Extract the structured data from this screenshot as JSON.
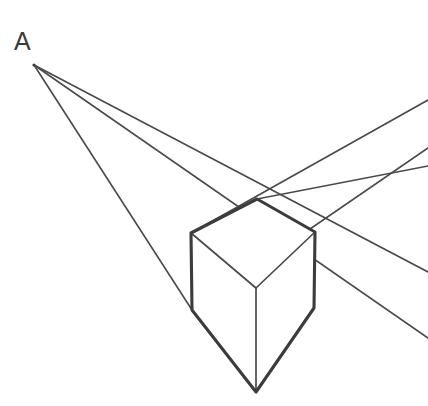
{
  "figure": {
    "type": "line-diagram",
    "canvas": {
      "width": 428,
      "height": 406,
      "background": "#ffffff"
    },
    "stroke_colors": {
      "construction": "#4a4a4a",
      "cube_heavy": "#3c3c3c",
      "cube_light": "#4a4a4a",
      "label": "#3a3a3a"
    },
    "stroke_widths": {
      "construction": 1.6,
      "cube_heavy": 3.1,
      "cube_light": 1.7
    }
  },
  "labels": {
    "vanishing_point_a": {
      "text": "A",
      "x": 14,
      "y": 50,
      "font_size": 25
    }
  },
  "geometry": {
    "vanishing_point_left": {
      "name": "A",
      "x": 34,
      "y": 65
    },
    "vanishing_point_right": {
      "name": "B",
      "x": 560,
      "y": 150,
      "offscreen": true
    },
    "cube_vertices": {
      "top_apex": {
        "x": 257,
        "y": 199
      },
      "left_top": {
        "x": 191,
        "y": 233
      },
      "right_top": {
        "x": 315,
        "y": 232
      },
      "center": {
        "x": 256,
        "y": 288
      },
      "left_bottom": {
        "x": 192,
        "y": 310
      },
      "right_bottom": {
        "x": 314,
        "y": 308
      },
      "bottom_apex": {
        "x": 256,
        "y": 392
      }
    },
    "construction_rays_from_a": [
      {
        "name": "ray-a-top",
        "from": [
          34,
          65
        ],
        "to": [
          428,
          272
        ]
      },
      {
        "name": "ray-a-middle",
        "from": [
          34,
          65
        ],
        "to": [
          428,
          338
        ]
      },
      {
        "name": "ray-a-lower",
        "from": [
          34,
          65
        ],
        "to": [
          192,
          310
        ]
      }
    ],
    "construction_rays_from_b": [
      {
        "name": "ray-b-upper",
        "from": [
          428,
          100
        ],
        "to": [
          191,
          233
        ]
      },
      {
        "name": "ray-b-middle",
        "from": [
          428,
          148
        ],
        "to": [
          192,
          310
        ]
      },
      {
        "name": "ray-b-through-apex",
        "from": [
          428,
          165
        ],
        "to": [
          257,
          199
        ]
      }
    ],
    "cube_edges": {
      "heavy": [
        {
          "name": "edge-top-left",
          "from": [
            191,
            233
          ],
          "to": [
            257,
            199
          ]
        },
        {
          "name": "edge-top-right",
          "from": [
            257,
            199
          ],
          "to": [
            315,
            232
          ]
        },
        {
          "name": "edge-vertical-left",
          "from": [
            191,
            233
          ],
          "to": [
            192,
            310
          ]
        },
        {
          "name": "edge-vertical-right",
          "from": [
            315,
            232
          ],
          "to": [
            314,
            308
          ]
        },
        {
          "name": "edge-bottom-left",
          "from": [
            192,
            310
          ],
          "to": [
            256,
            392
          ]
        },
        {
          "name": "edge-bottom-right",
          "from": [
            314,
            308
          ],
          "to": [
            256,
            392
          ]
        }
      ],
      "light": [
        {
          "name": "edge-inner-left",
          "from": [
            191,
            233
          ],
          "to": [
            256,
            288
          ]
        },
        {
          "name": "edge-inner-right",
          "from": [
            315,
            232
          ],
          "to": [
            256,
            288
          ]
        },
        {
          "name": "edge-inner-vertical",
          "from": [
            256,
            288
          ],
          "to": [
            256,
            392
          ]
        }
      ]
    }
  }
}
